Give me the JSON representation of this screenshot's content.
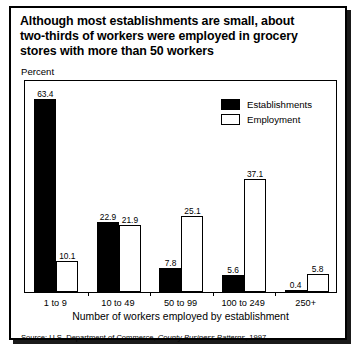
{
  "title": {
    "line1": "Although most establishments are small, about",
    "line2": "two-thirds of workers were employed in grocery",
    "line3": "stores with more than 50 workers"
  },
  "axis": {
    "unit_label": "Percent",
    "xlabel": "Number of workers employed by establishment"
  },
  "legend": {
    "series1": "Establishments",
    "series2": "Employment"
  },
  "source": {
    "prefix": "Source: U.S. Department of Commerce, ",
    "publication": "County Business Patterns",
    "suffix": ", 1997"
  },
  "chart_data": {
    "type": "bar",
    "title": "Although most establishments are small, about two-thirds of workers were employed in grocery stores with more than 50 workers",
    "xlabel": "Number of workers employed by establishment",
    "ylabel": "Percent",
    "ylim": [
      0,
      70
    ],
    "grid": false,
    "legend_position": "top-right",
    "categories": [
      "1 to 9",
      "10 to 49",
      "50 to 99",
      "100 to 249",
      "250+"
    ],
    "series": [
      {
        "name": "Establishments",
        "color": "#000000",
        "values": [
          63.4,
          22.9,
          7.8,
          5.6,
          0.4
        ],
        "labels": [
          "63.4",
          "22.9",
          "7.8",
          "5.6",
          "0.4"
        ]
      },
      {
        "name": "Employment",
        "color": "#ffffff",
        "values": [
          10.1,
          21.9,
          25.1,
          37.1,
          5.8
        ],
        "labels": [
          "10.1",
          "21.9",
          "25.1",
          "37.1",
          "5.8"
        ]
      }
    ]
  }
}
